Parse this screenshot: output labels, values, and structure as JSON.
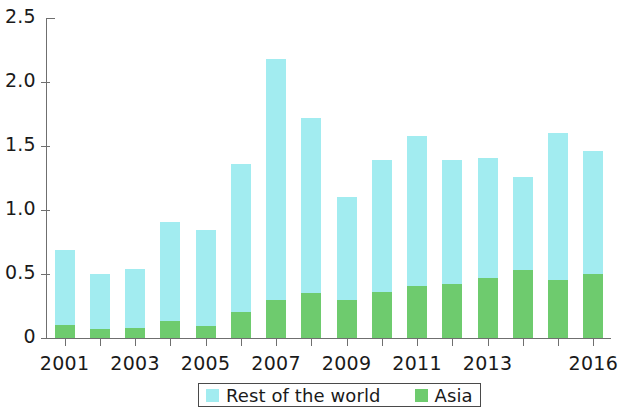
{
  "chart_data": {
    "type": "bar",
    "stacked": true,
    "title": "",
    "subtitle": "",
    "xlabel": "",
    "ylabel": "",
    "categories": [
      "2001",
      "2002",
      "2003",
      "2004",
      "2005",
      "2006",
      "2007",
      "2008",
      "2009",
      "2010",
      "2011",
      "2012",
      "2013",
      "2014",
      "2015",
      "2016"
    ],
    "x_tick_labels": [
      "2001",
      "",
      "2003",
      "",
      "2005",
      "",
      "2007",
      "",
      "2009",
      "",
      "2011",
      "",
      "2013",
      "",
      "",
      "2016"
    ],
    "series": [
      {
        "name": "Asia",
        "color": "#6ECB6E",
        "values": [
          0.1,
          0.07,
          0.08,
          0.13,
          0.09,
          0.2,
          0.3,
          0.35,
          0.3,
          0.36,
          0.41,
          0.42,
          0.47,
          0.53,
          0.45,
          0.5
        ]
      },
      {
        "name": "Rest of the world",
        "color": "#A2ECF0",
        "values": [
          0.59,
          0.43,
          0.46,
          0.78,
          0.75,
          1.16,
          1.88,
          1.37,
          0.8,
          1.03,
          1.17,
          0.97,
          0.94,
          0.73,
          1.15,
          0.96
        ]
      }
    ],
    "totals": [
      0.69,
      0.5,
      0.54,
      0.91,
      0.84,
      1.36,
      2.18,
      1.72,
      1.1,
      1.39,
      1.58,
      1.39,
      1.41,
      1.26,
      1.6,
      1.46
    ],
    "ylim": [
      0,
      2.5
    ],
    "y_ticks": [
      0,
      0.5,
      1.0,
      1.5,
      2.0,
      2.5
    ],
    "y_tick_labels": [
      "0",
      "0.5",
      "1.0",
      "1.5",
      "2.0",
      "2.5"
    ],
    "grid": false,
    "legend_position": "bottom-center",
    "legend_entries": [
      "Rest of the world",
      "Asia"
    ]
  },
  "legend": {
    "entries": [
      {
        "label": "Rest of the world",
        "color": "#A2ECF0"
      },
      {
        "label": "Asia",
        "color": "#6ECB6E"
      }
    ]
  },
  "colors": {
    "rest_of_world": "#A2ECF0",
    "asia": "#6ECB6E",
    "axis": "#6f6f6f",
    "text": "#1a1a1a",
    "background": "#ffffff"
  }
}
